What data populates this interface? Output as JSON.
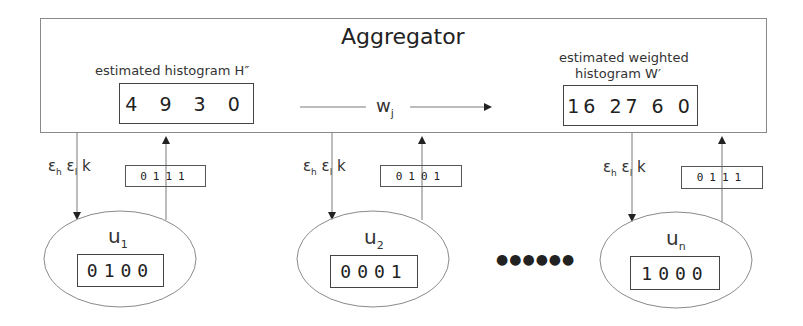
{
  "aggregator": {
    "title": "Aggregator",
    "estimated_histogram": {
      "label": "estimated histogram H″",
      "values": "4 9 3 0"
    },
    "weight_label": {
      "base": "w",
      "sub": "j"
    },
    "estimated_weighted_histogram": {
      "label_line1": "estimated weighted",
      "label_line2": "histogram W′",
      "values": "16 27 6 0"
    }
  },
  "users": [
    {
      "name": {
        "base": "u",
        "sub": "1"
      },
      "vector": "0100",
      "params": {
        "eps_h": "ε",
        "eps_h_sub": "h",
        "eps_l": "ε",
        "eps_l_sub": "l",
        "k": "k"
      },
      "report": "0111"
    },
    {
      "name": {
        "base": "u",
        "sub": "2"
      },
      "vector": "0001",
      "params": {
        "eps_h": "ε",
        "eps_h_sub": "h",
        "eps_l": "ε",
        "eps_l_sub": "l",
        "k": "k"
      },
      "report": "0101"
    },
    {
      "name": {
        "base": "u",
        "sub": "n"
      },
      "vector": "1000",
      "params": {
        "eps_h": "ε",
        "eps_h_sub": "h",
        "eps_l": "ε",
        "eps_l_sub": "l",
        "k": "k"
      },
      "report": "0111"
    }
  ],
  "ellipsis": "●●●●●●",
  "colors": {
    "line": "#7a7a7a",
    "arrow": "#222222",
    "text": "#2a2a2a"
  }
}
